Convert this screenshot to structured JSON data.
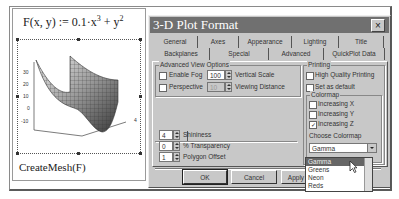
{
  "worksheet": {
    "formula": {
      "lhs": "F(x, y)",
      "assign": ":=",
      "coef": "0.1",
      "dot": "·",
      "x": "x",
      "xexp": "3",
      "plus": "+",
      "y": "y",
      "yexp": "2"
    },
    "plot": {
      "z_ticks": [
        "30",
        "20",
        "10",
        "0",
        "-10"
      ],
      "x_ticks": [
        "-4",
        "-2",
        "0",
        "2",
        "4"
      ],
      "y_ticks": [
        "4"
      ]
    },
    "caption": "CreateMesh(F)"
  },
  "dialog": {
    "title": "3-D Plot Format",
    "close_label": "×",
    "tabs_row1": [
      {
        "label": "General"
      },
      {
        "label": "Axes"
      },
      {
        "label": "Appearance"
      },
      {
        "label": "Lighting"
      },
      {
        "label": "Title"
      }
    ],
    "tabs_row2": [
      {
        "label": "Backplanes"
      },
      {
        "label": "Special"
      },
      {
        "label": "Advanced",
        "active": true
      },
      {
        "label": "QuickPlot Data"
      }
    ],
    "advanced_view": {
      "label": "Advanced View Options",
      "enable_fog": {
        "label": "Enable Fog",
        "checked": false
      },
      "perspective": {
        "label": "Perspective",
        "checked": false
      },
      "vertical_scale": {
        "value": "100",
        "label": "Vertical Scale"
      },
      "viewing_distance": {
        "value": "10",
        "label": "Viewing Distance"
      }
    },
    "printing": {
      "label": "Printing",
      "high_quality": {
        "label": "High Quality Printing",
        "checked": false
      },
      "set_default": {
        "label": "Set as default",
        "checked": false
      }
    },
    "colormap": {
      "label": "Colormap",
      "increasing_x": {
        "label": "Increasing X",
        "checked": false
      },
      "increasing_y": {
        "label": "Increasing Y",
        "checked": false
      },
      "increasing_z": {
        "label": "Increasing Z",
        "checked": true
      },
      "choose_label": "Choose Colormap",
      "selected": "Gamma",
      "options": [
        "Gamma",
        "Greens",
        "Neon",
        "Reds"
      ]
    },
    "plot_tab": {
      "label": "Plot1"
    },
    "shininess": {
      "value": "4",
      "label": "Shininess"
    },
    "transparency": {
      "value": "0",
      "label": "% Transparency"
    },
    "polygon_offset": {
      "value": "1",
      "label": "Polygon Offset"
    },
    "buttons": {
      "ok": "OK",
      "cancel": "Cancel",
      "apply": "Apply"
    }
  }
}
